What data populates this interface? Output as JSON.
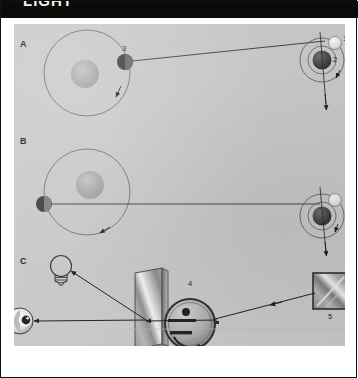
{
  "header": {
    "caption": "LIGHT"
  },
  "figure": {
    "background_color": "#c9c9c9",
    "frame_color": "#111111",
    "panels": [
      {
        "id": "A",
        "label": "A",
        "description": "Jupiter with Io on near side of its orbit; line of sight to Earth orbiting the Sun",
        "elements": [
          {
            "name": "jupiter-orbit-circle-a",
            "kind": "orbit"
          },
          {
            "name": "jupiter-body-a",
            "kind": "planet"
          },
          {
            "name": "io-moon-a",
            "kind": "moon",
            "number": "3"
          },
          {
            "name": "orbit-direction-arrow-a",
            "kind": "arrow"
          },
          {
            "name": "sight-line-a",
            "kind": "line"
          },
          {
            "name": "earth-orbit-circle-a",
            "kind": "orbit"
          },
          {
            "name": "sun-body-a",
            "kind": "star",
            "number": "2"
          },
          {
            "name": "earth-body-a",
            "kind": "planet",
            "number": "1"
          },
          {
            "name": "earth-orbit-arrow-a",
            "kind": "arrow"
          },
          {
            "name": "axis-line-a",
            "kind": "line"
          },
          {
            "name": "axis-arrow-a",
            "kind": "arrow"
          }
        ]
      },
      {
        "id": "B",
        "label": "B",
        "description": "Jupiter with Io on far side of its orbit; longer light path to Earth",
        "elements": [
          {
            "name": "jupiter-orbit-circle-b",
            "kind": "orbit"
          },
          {
            "name": "jupiter-body-b",
            "kind": "planet"
          },
          {
            "name": "io-moon-b",
            "kind": "moon"
          },
          {
            "name": "orbit-direction-arrow-b",
            "kind": "arrow"
          },
          {
            "name": "sight-line-b",
            "kind": "line"
          },
          {
            "name": "earth-orbit-circle-b",
            "kind": "orbit"
          },
          {
            "name": "sun-body-b",
            "kind": "star"
          },
          {
            "name": "earth-body-b",
            "kind": "planet"
          },
          {
            "name": "earth-orbit-arrow-b",
            "kind": "arrow"
          },
          {
            "name": "axis-line-b",
            "kind": "line"
          },
          {
            "name": "axis-arrow-b",
            "kind": "arrow"
          }
        ]
      },
      {
        "id": "C",
        "label": "C",
        "description": "Fizeau toothed-wheel apparatus: lamp, eye, half-silvered glass, rotating toothed wheel and distant mirror",
        "elements": [
          {
            "name": "light-bulb-icon",
            "kind": "lamp"
          },
          {
            "name": "eye-icon",
            "kind": "observer"
          },
          {
            "name": "half-silvered-glass",
            "kind": "beam-splitter"
          },
          {
            "name": "toothed-wheel",
            "kind": "chopper",
            "number": "4"
          },
          {
            "name": "distant-mirror",
            "kind": "mirror",
            "number": "5"
          },
          {
            "name": "beam-lamp-to-glass",
            "kind": "ray"
          },
          {
            "name": "beam-glass-to-eye",
            "kind": "ray"
          },
          {
            "name": "beam-glass-to-mirror",
            "kind": "ray"
          }
        ]
      }
    ],
    "callouts": [
      {
        "number": "1",
        "meaning": "Earth"
      },
      {
        "number": "2",
        "meaning": "Sun"
      },
      {
        "number": "3",
        "meaning": "Io / Jupiter moon"
      },
      {
        "number": "4",
        "meaning": "Toothed wheel"
      },
      {
        "number": "5",
        "meaning": "Mirror"
      }
    ],
    "callout_values": {
      "n1": "1",
      "n2": "2",
      "n3": "3",
      "n4": "4",
      "n5": "5"
    },
    "panel_labels": {
      "a": "A",
      "b": "B",
      "c": "C"
    }
  }
}
